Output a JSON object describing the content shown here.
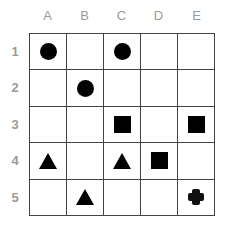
{
  "columns": [
    "A",
    "B",
    "C",
    "D",
    "E"
  ],
  "rows": [
    "1",
    "2",
    "3",
    "4",
    "5"
  ],
  "grid": [
    [
      "circle",
      "",
      "circle",
      "",
      ""
    ],
    [
      "",
      "circle",
      "",
      "",
      ""
    ],
    [
      "",
      "",
      "square",
      "",
      "square"
    ],
    [
      "triangle",
      "",
      "triangle",
      "square",
      ""
    ],
    [
      "",
      "triangle",
      "",
      "",
      "cross"
    ]
  ],
  "colors": {
    "shape": "#000000",
    "grid_line": "#444444",
    "label": "#9a9a9a"
  }
}
